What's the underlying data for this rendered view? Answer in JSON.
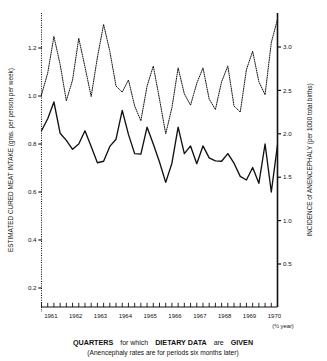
{
  "chart_data": {
    "type": "line",
    "title": "",
    "xlabel": "QUARTERS for which DIETARY DATA are GIVEN",
    "xlabel_sub": "(Anencephaly rates are for periods six months later)",
    "ylabel_left": "ESTIMATED CURED MEAT INTAKE (gms. per person per week)",
    "ylabel_right": "INCIDENCE of ANENCEPHALY (per 1000 total births)",
    "x_axis_note": "(½ year)",
    "grid": false,
    "legend": "none",
    "x_tick_labels": [
      "1961",
      "1962",
      "1963",
      "1964",
      "1965",
      "1966",
      "1967",
      "1968",
      "1969",
      "1970"
    ],
    "left_tick_labels": [
      "1.2",
      "1.0",
      "0.8",
      "0.6",
      "0.4",
      "0.2"
    ],
    "left_tick_values": [
      1.2,
      1.0,
      0.8,
      0.6,
      0.4,
      0.2
    ],
    "right_tick_labels": [
      "3.0",
      "2.5",
      "2.0",
      "1.5",
      "1.0",
      "0.5"
    ],
    "right_tick_values": [
      3.0,
      2.5,
      2.0,
      1.5,
      1.0,
      0.5
    ],
    "ylim_left": [
      0.0,
      1.35
    ],
    "ylim_right": [
      0.0,
      3.35
    ],
    "xlim": [
      "1960.75",
      "1970.5"
    ],
    "x_quarters": [
      1960.75,
      1961.0,
      1961.25,
      1961.5,
      1961.75,
      1962.0,
      1962.25,
      1962.5,
      1962.75,
      1963.0,
      1963.25,
      1963.5,
      1963.75,
      1964.0,
      1964.25,
      1964.5,
      1964.75,
      1965.0,
      1965.25,
      1965.5,
      1965.75,
      1966.0,
      1966.25,
      1966.5,
      1966.75,
      1967.0,
      1967.25,
      1967.5,
      1967.75,
      1968.0,
      1968.25,
      1968.5,
      1968.75,
      1969.0,
      1969.25,
      1969.5,
      1969.75,
      1970.0,
      1970.25
    ],
    "series": [
      {
        "name": "Estimated cured meat intake",
        "style": "solid",
        "axis": "left",
        "units": "gms. per person per week",
        "values": [
          0.855,
          0.905,
          0.975,
          0.845,
          0.815,
          0.778,
          0.8,
          0.855,
          0.79,
          0.722,
          0.728,
          0.79,
          0.82,
          0.94,
          0.84,
          0.76,
          0.758,
          0.87,
          0.8,
          0.725,
          0.64,
          0.72,
          0.87,
          0.76,
          0.792,
          0.718,
          0.792,
          0.742,
          0.73,
          0.728,
          0.76,
          0.72,
          0.665,
          0.65,
          0.702,
          0.636,
          0.8,
          0.6,
          0.795
        ]
      },
      {
        "name": "Incidence of anencephaly",
        "style": "dotted",
        "axis": "right",
        "units": "per 1000 total births",
        "values": [
          2.45,
          2.7,
          3.12,
          2.8,
          2.38,
          2.62,
          3.1,
          2.77,
          2.43,
          2.88,
          3.26,
          2.95,
          2.55,
          2.48,
          2.62,
          2.32,
          2.15,
          2.55,
          2.78,
          2.4,
          2.0,
          2.3,
          2.76,
          2.46,
          2.33,
          2.58,
          2.76,
          2.4,
          2.28,
          2.6,
          2.78,
          2.32,
          2.25,
          2.74,
          2.95,
          2.6,
          2.45,
          3.05,
          3.32
        ]
      }
    ]
  },
  "axis": {
    "left_label": "ESTIMATED CURED MEAT INTAKE (gms. per person per week)",
    "right_label": "INCIDENCE of ANENCEPHALY (per 1000 total births)"
  },
  "caption": {
    "line1_a": "QUARTERS",
    "line1_b": "for which",
    "line1_c": "DIETARY  DATA",
    "line1_d": "are",
    "line1_e": "GIVEN",
    "line2": "(Anencephaly rates are for periods  six months  later)"
  }
}
